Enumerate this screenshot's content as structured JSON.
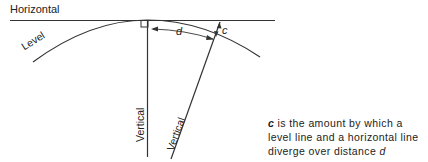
{
  "diagram": {
    "labels": {
      "horizontal": "Horizontal",
      "level": "Level",
      "vertical": "Vertical",
      "vertical_tilted": "Vertical",
      "d": "d",
      "c": "c"
    },
    "caption": {
      "c_symbol": "c",
      "text_1": " is the amount by which a level line and a horizontal line diverge over distance ",
      "d_symbol": "d"
    }
  }
}
